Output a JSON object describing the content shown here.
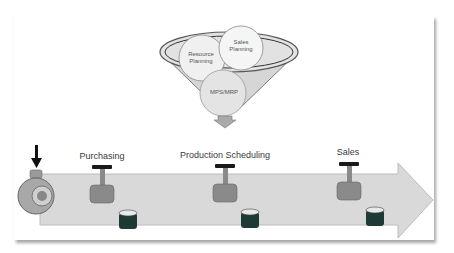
{
  "diagram": {
    "funnel": {
      "circles": [
        {
          "label": "Resource\nPlanning"
        },
        {
          "label": "Sales\nPlanning"
        },
        {
          "label": "MPS/MRP"
        }
      ]
    },
    "stages": [
      {
        "label": "Purchasing"
      },
      {
        "label": "Production Scheduling"
      },
      {
        "label": "Sales"
      }
    ],
    "input_arrow": {
      "icon": "down-arrow-icon"
    },
    "source": {
      "icon": "pump-icon"
    },
    "flow": {
      "icon": "right-arrow-pipeline"
    },
    "colors": {
      "pipe": "#d9d9d9",
      "pipe_border": "#bfbfbf",
      "funnel": "#d6d6d6",
      "valve_handle": "#1a1a1a",
      "valve_body": "#8a8a8a",
      "tank_fill": "#1d3b34",
      "text": "#3a3a3a"
    }
  }
}
